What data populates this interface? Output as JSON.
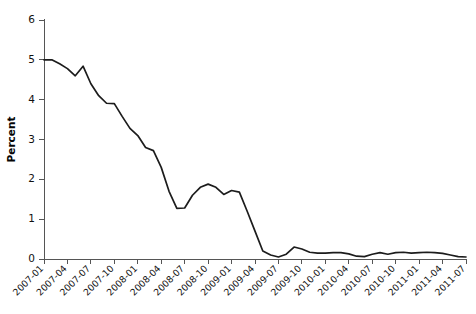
{
  "chart_data": {
    "type": "line",
    "title": "",
    "subtitle": "",
    "xlabel": "",
    "ylabel": "Percent",
    "ylim": [
      0,
      6
    ],
    "yticks": [
      0,
      1,
      2,
      3,
      4,
      5,
      6
    ],
    "ytick_labels": [
      "0",
      "1",
      "2",
      "3",
      "4",
      "5",
      "6"
    ],
    "grid": false,
    "legend": null,
    "legend_position": "none",
    "xtick_labels": [
      "2007-01",
      "2007-04",
      "2007-07",
      "2007-10",
      "2008-01",
      "2008-04",
      "2008-07",
      "2008-10",
      "2009-01",
      "2009-04",
      "2009-07",
      "2009-10",
      "2010-01",
      "2010-04",
      "2010-07",
      "2010-10",
      "2011-01",
      "2011-04",
      "2011-07"
    ],
    "xtick_rotation": 45,
    "line_color": "#1c1c1c",
    "axis_color": "#555555",
    "series": [
      {
        "name": "Percent",
        "x": [
          "2007-01",
          "2007-02",
          "2007-03",
          "2007-04",
          "2007-05",
          "2007-06",
          "2007-07",
          "2007-08",
          "2007-09",
          "2007-10",
          "2007-11",
          "2007-12",
          "2008-01",
          "2008-02",
          "2008-03",
          "2008-04",
          "2008-05",
          "2008-06",
          "2008-07",
          "2008-08",
          "2008-09",
          "2008-10",
          "2008-11",
          "2008-12",
          "2009-01",
          "2009-02",
          "2009-03",
          "2009-04",
          "2009-05",
          "2009-06",
          "2009-07",
          "2009-08",
          "2009-09",
          "2009-10",
          "2009-11",
          "2009-12",
          "2010-01",
          "2010-02",
          "2010-03",
          "2010-04",
          "2010-05",
          "2010-06",
          "2010-07",
          "2010-08",
          "2010-09",
          "2010-10",
          "2010-11",
          "2010-12",
          "2011-01",
          "2011-02",
          "2011-03",
          "2011-04",
          "2011-05",
          "2011-06",
          "2011-07"
        ],
        "values": [
          5.0,
          5.0,
          4.9,
          4.78,
          4.6,
          4.84,
          4.4,
          4.1,
          3.91,
          3.9,
          3.58,
          3.28,
          3.1,
          2.8,
          2.72,
          2.3,
          1.7,
          1.27,
          1.28,
          1.6,
          1.8,
          1.88,
          1.8,
          1.62,
          1.72,
          1.68,
          1.2,
          0.7,
          0.2,
          0.1,
          0.05,
          0.12,
          0.3,
          0.25,
          0.17,
          0.15,
          0.15,
          0.16,
          0.16,
          0.13,
          0.07,
          0.06,
          0.12,
          0.16,
          0.12,
          0.16,
          0.17,
          0.15,
          0.16,
          0.17,
          0.16,
          0.14,
          0.1,
          0.06,
          0.05
        ]
      }
    ]
  }
}
